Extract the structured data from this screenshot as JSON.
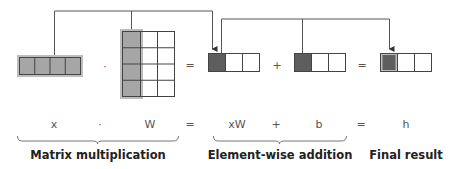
{
  "diagram": {
    "colors": {
      "line": "#555555",
      "shaded_light": "#a6a6a6",
      "shaded_frame": "#bdbdbd",
      "shaded_dark": "#5e5e5e",
      "cell_border": "#444444",
      "cell_empty": "#ffffff"
    },
    "operators_top": {
      "dot": "·",
      "equals_1": "=",
      "plus": "+",
      "equals_2": "="
    },
    "equation": {
      "x": "x",
      "dot": "·",
      "W": "W",
      "eq1": "=",
      "xW": "xW",
      "plus": "+",
      "b": "b",
      "eq2": "=",
      "h": "h"
    },
    "captions": {
      "matmul": "Matrix multiplication",
      "elementwise": "Element-wise addition",
      "final": "Final result"
    },
    "shapes": {
      "x": {
        "rows": 1,
        "cols": 4,
        "shaded": "all"
      },
      "W": {
        "rows": 4,
        "cols": 3,
        "shaded": "first-column"
      },
      "xW": {
        "rows": 1,
        "cols": 3,
        "shaded": "first-cell"
      },
      "b": {
        "rows": 1,
        "cols": 3,
        "shaded": "first-cell"
      },
      "h": {
        "rows": 1,
        "cols": 3,
        "shaded": "first-cell"
      }
    }
  }
}
